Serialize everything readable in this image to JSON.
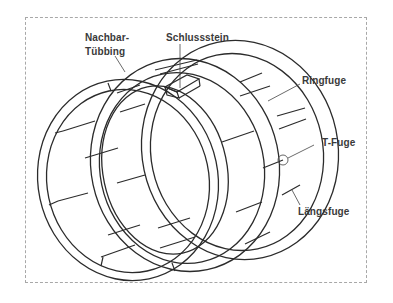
{
  "figure": {
    "frame_border_color": "#a8a8a8",
    "line_color": "#2b2b2b"
  },
  "labels": {
    "nachbar_tuebbing_line1": "Nachbar-",
    "nachbar_tuebbing_line2": "Tübbing",
    "schlussstein": "Schlussstein",
    "ringfuge": "Ringfuge",
    "t_fuge": "T-Fuge",
    "laengsfuge": "Längsfuge"
  }
}
